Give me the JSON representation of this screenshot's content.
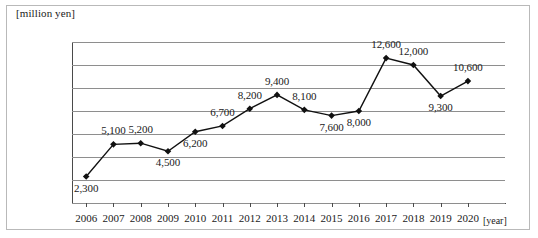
{
  "chart_data": {
    "type": "line",
    "title": "",
    "unit_label": "[million yen]",
    "xlabel": "[year]",
    "ylabel": "",
    "categories": [
      "2006",
      "2007",
      "2008",
      "2009",
      "2010",
      "2011",
      "2012",
      "2013",
      "2014",
      "2015",
      "2016",
      "2017",
      "2018",
      "2019",
      "2020"
    ],
    "values": [
      2300,
      5100,
      5200,
      4500,
      6200,
      6700,
      8200,
      9400,
      8100,
      7600,
      8000,
      12600,
      12000,
      9300,
      10600
    ],
    "value_labels": [
      "2,300",
      "5,100",
      "5,200",
      "4,500",
      "6,200",
      "6,700",
      "8,200",
      "9,400",
      "8,100",
      "7,600",
      "8,000",
      "12,600",
      "12,000",
      "9,300",
      "10,600"
    ],
    "ylim": [
      0,
      14000
    ],
    "ytick_values": [
      0,
      2000,
      4000,
      6000,
      8000,
      10000,
      12000,
      14000
    ],
    "ytick_labels": [
      "0",
      "2,000",
      "4,000",
      "6,000",
      "8,000",
      "10,000",
      "12,000",
      "14,000"
    ],
    "grid": true,
    "legend": "none",
    "marker": "diamond",
    "line_color": "#111111",
    "grid_color": "#8e8e8e",
    "label_positions": [
      "below",
      "above",
      "above",
      "below",
      "below",
      "above",
      "above",
      "above",
      "above",
      "below",
      "below",
      "above",
      "above",
      "below",
      "above"
    ]
  }
}
